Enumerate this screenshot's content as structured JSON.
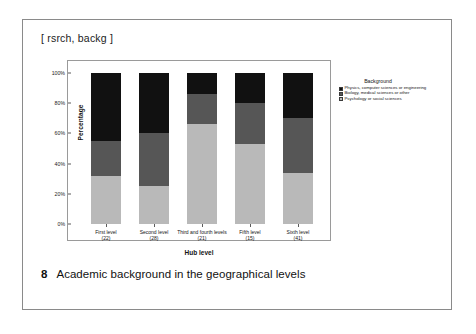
{
  "header": {
    "tag": "[ rsrch, backg ]"
  },
  "caption": {
    "number": "8",
    "text": "Academic background in the geographical levels"
  },
  "legend": {
    "title": "Background",
    "entries": [
      {
        "label": "Physics, computer sciences or engineering",
        "color": "#111111"
      },
      {
        "label": "Biology, medical sciences or other",
        "color": "#565656"
      },
      {
        "label": "Psychology or social sciences",
        "color": "#b9b9b9"
      }
    ]
  },
  "chart_data": {
    "type": "bar",
    "stacked": true,
    "stack_mode": "percent",
    "title": "",
    "xlabel": "Hub level",
    "ylabel": "Percentage",
    "ylim": [
      0,
      100
    ],
    "yticks": [
      0,
      20,
      40,
      60,
      80,
      100
    ],
    "ytick_labels": [
      "0%",
      "20%",
      "40%",
      "60%",
      "80%",
      "100%"
    ],
    "grid": false,
    "legend_position": "right",
    "categories": [
      "First level",
      "Second level",
      "Third and fourth levels",
      "Fifth level",
      "Sixth level"
    ],
    "category_counts": [
      "(22)",
      "(28)",
      "(21)",
      "(15)",
      "(41)"
    ],
    "category_labels": [
      "First level\n(22)",
      "Second level\n(28)",
      "Third and fourth levels\n(21)",
      "Fifth level\n(15)",
      "Sixth level\n(41)"
    ],
    "series": [
      {
        "name": "Psychology or social sciences",
        "color": "#b9b9b9",
        "values": [
          32,
          25,
          66,
          53,
          34
        ]
      },
      {
        "name": "Biology, medical sciences or other",
        "color": "#565656",
        "values": [
          23,
          35,
          20,
          27,
          36
        ]
      },
      {
        "name": "Physics, computer sciences or engineering",
        "color": "#111111",
        "values": [
          45,
          40,
          14,
          20,
          30
        ]
      }
    ]
  }
}
